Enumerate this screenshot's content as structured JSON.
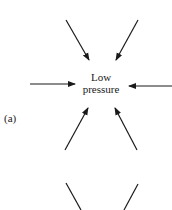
{
  "diagram": {
    "center_label_line1": "Low",
    "center_label_line2": "pressure",
    "panel_label": "(a)",
    "stroke_color": "#1a1a1a",
    "background": "#ffffff",
    "arrows": [
      {
        "name": "upper-left-inflow",
        "direction": "toward-center"
      },
      {
        "name": "upper-right-inflow",
        "direction": "toward-center"
      },
      {
        "name": "left-inflow",
        "direction": "toward-center"
      },
      {
        "name": "right-inflow",
        "direction": "toward-center"
      },
      {
        "name": "lower-left-inflow",
        "direction": "toward-center"
      },
      {
        "name": "lower-right-inflow",
        "direction": "toward-center"
      }
    ]
  }
}
